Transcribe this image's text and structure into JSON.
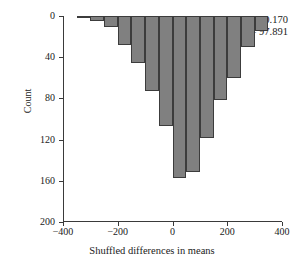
{
  "chart_data": {
    "type": "bar",
    "title": "",
    "subtitle": "",
    "xlabel": "Shuffled differences in means",
    "ylabel": "Count",
    "xlim": [
      -400,
      400
    ],
    "ylim": [
      0,
      200
    ],
    "y_axis_inverted": true,
    "grid": false,
    "legend": null,
    "bin_width": 50,
    "bar_color": "#808080",
    "bar_edge_color": "#3c3c3c",
    "xticks": [
      -400,
      -200,
      0,
      200,
      400
    ],
    "xtick_labels": [
      "−400",
      "−200",
      "0",
      "200",
      "400"
    ],
    "yticks": [
      0,
      40,
      80,
      120,
      160,
      200
    ],
    "ytick_labels": [
      "0",
      "40",
      "80",
      "120",
      "160",
      "200"
    ],
    "categories": [
      -325,
      -275,
      -225,
      -175,
      -125,
      -75,
      -25,
      25,
      75,
      125,
      175,
      225,
      275,
      325
    ],
    "bin_edges": [
      -350,
      -300,
      -250,
      -200,
      -150,
      -100,
      -50,
      0,
      50,
      100,
      150,
      200,
      250,
      300,
      350
    ],
    "values": [
      2,
      5,
      11,
      28,
      46,
      73,
      107,
      157,
      151,
      118,
      82,
      60,
      30,
      15
    ],
    "annotations": [
      {
        "name": "mean",
        "label": "Mean",
        "value": "0.170",
        "text": "Mean = 0.170"
      },
      {
        "name": "sd",
        "label": "SD",
        "value": "97.891",
        "text": "SD = 97.891"
      }
    ]
  }
}
